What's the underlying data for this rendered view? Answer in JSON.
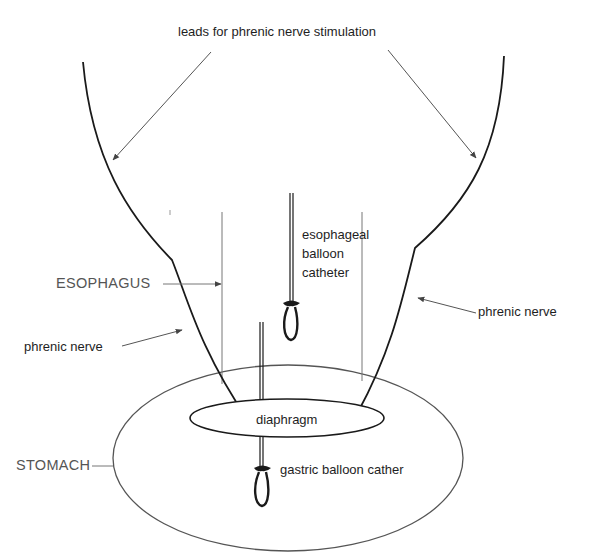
{
  "diagram": {
    "title": "leads for phrenic nerve stimulation",
    "labels": {
      "leads": "leads for phrenic nerve stimulation",
      "esophageal_catheter_line1": "esophageal",
      "esophageal_catheter_line2": "balloon",
      "esophageal_catheter_line3": "catheter",
      "esophagus": "ESOPHAGUS",
      "phrenic_nerve_left": "phrenic nerve",
      "phrenic_nerve_right": "phrenic nerve",
      "diaphragm": "diaphragm",
      "stomach": "STOMACH",
      "gastric_catheter": "gastric balloon cather"
    },
    "colors": {
      "background": "#ffffff",
      "stroke_dark": "#1a1a1a",
      "stroke_light": "#6a6a6a",
      "text": "#1e1e1e",
      "organ_label": "#555555"
    }
  }
}
